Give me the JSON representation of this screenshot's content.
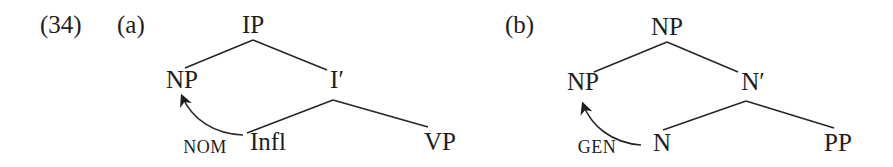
{
  "example": {
    "number": "(34)",
    "trees": [
      {
        "label": "(a)",
        "nodes": {
          "root": "IP",
          "spec": "NP",
          "bar": "I′",
          "head": "Infl",
          "complement": "VP"
        },
        "case_assignment": {
          "label": "NOM",
          "from": "Infl",
          "to": "NP"
        }
      },
      {
        "label": "(b)",
        "nodes": {
          "root": "NP",
          "spec": "NP",
          "bar": "N′",
          "head": "N",
          "complement": "PP"
        },
        "case_assignment": {
          "label": "GEN",
          "from": "N",
          "to": "NP"
        }
      }
    ]
  },
  "colors": {
    "text": "#1e1e1e",
    "lines": "#262626",
    "background": "#ffffff"
  }
}
